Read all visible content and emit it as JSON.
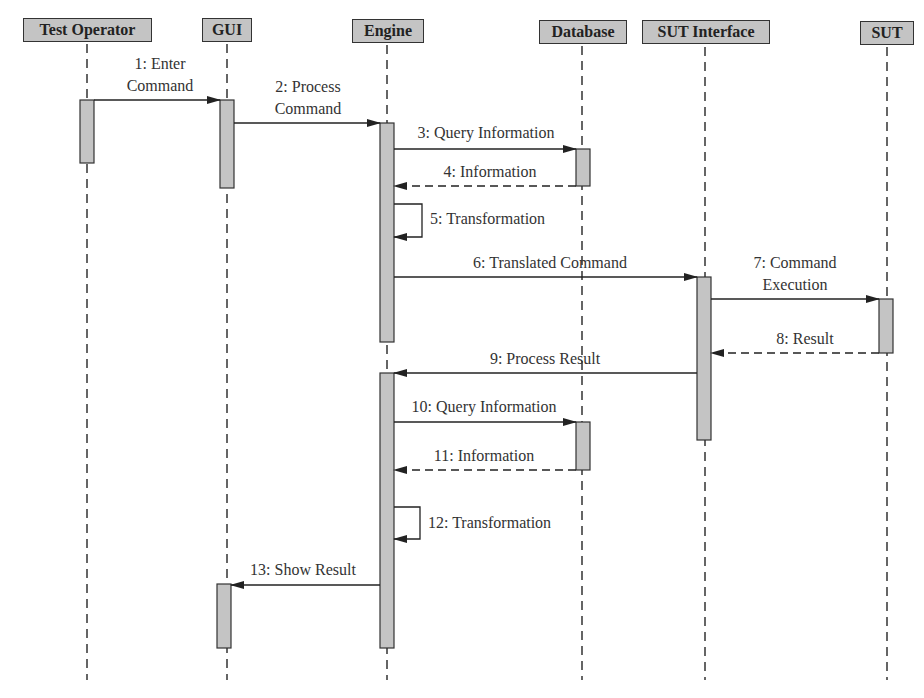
{
  "diagram": {
    "type": "sequence",
    "participants": [
      {
        "name": "Test Operator"
      },
      {
        "name": "GUI"
      },
      {
        "name": "Engine"
      },
      {
        "name": "Database"
      },
      {
        "name": "SUT Interface"
      },
      {
        "name": "SUT"
      }
    ],
    "messages": [
      {
        "label": "1: Enter Command",
        "line1": "1: Enter",
        "line2": "Command",
        "from": "Test Operator",
        "to": "GUI",
        "style": "solid"
      },
      {
        "label": "2: Process Command",
        "line1": "2: Process",
        "line2": "Command",
        "from": "GUI",
        "to": "Engine",
        "style": "solid"
      },
      {
        "label": "3: Query Information",
        "from": "Engine",
        "to": "Database",
        "style": "solid"
      },
      {
        "label": "4: Information",
        "from": "Database",
        "to": "Engine",
        "style": "dashed"
      },
      {
        "label": "5: Transformation",
        "from": "Engine",
        "to": "Engine",
        "style": "self"
      },
      {
        "label": "6: Translated Command",
        "from": "Engine",
        "to": "SUT Interface",
        "style": "solid"
      },
      {
        "label": "7: Command Execution",
        "line1": "7: Command",
        "line2": "Execution",
        "from": "SUT Interface",
        "to": "SUT",
        "style": "solid"
      },
      {
        "label": "8: Result",
        "from": "SUT",
        "to": "SUT Interface",
        "style": "dashed"
      },
      {
        "label": "9: Process Result",
        "from": "SUT Interface",
        "to": "Engine",
        "style": "solid"
      },
      {
        "label": "10: Query Information",
        "from": "Engine",
        "to": "Database",
        "style": "solid"
      },
      {
        "label": "11: Information",
        "from": "Database",
        "to": "Engine",
        "style": "dashed"
      },
      {
        "label": "12: Transformation",
        "from": "Engine",
        "to": "Engine",
        "style": "self"
      },
      {
        "label": "13: Show Result",
        "from": "Engine",
        "to": "GUI",
        "style": "solid"
      }
    ]
  }
}
